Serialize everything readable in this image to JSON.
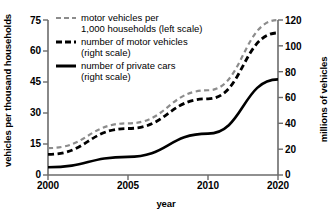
{
  "chart_data": {
    "type": "line",
    "title": "",
    "xlabel": "year",
    "ylabel_left": "vehicles per thousand households",
    "ylabel_right": "millions of vehicles",
    "x": [
      2000,
      2005,
      2010,
      2020
    ],
    "x_tick_labels": [
      "2000",
      "2005",
      "2010",
      "2020"
    ],
    "left_axis": {
      "label": "vehicles per thousand households",
      "ticks": [
        0,
        15,
        30,
        45,
        60,
        75
      ],
      "tick_labels": [
        "0",
        "15",
        "30",
        "45",
        "60",
        "75"
      ],
      "ylim": [
        0,
        75
      ]
    },
    "right_axis": {
      "label": "millions of vehicles",
      "ticks": [
        0,
        20,
        40,
        60,
        80,
        100,
        120
      ],
      "tick_labels": [
        "0",
        "20",
        "40",
        "60",
        "80",
        "100",
        "120"
      ],
      "ylim": [
        0,
        120
      ]
    },
    "grid": false,
    "legend_position": "upper-left-inside",
    "series": [
      {
        "name": "motor vehicles per 1,000 households (left scale)",
        "legend_line1": "motor vehicles per",
        "legend_line2": "1,000 households (left scale)",
        "axis": "left",
        "style": "dashed",
        "color": "#8c8c8c",
        "width": 2.2,
        "values": [
          13,
          25,
          41,
          75
        ]
      },
      {
        "name": "number of motor vehicles (right scale)",
        "legend_line1": "number of motor vehicles",
        "legend_line2": "(right scale)",
        "axis": "right",
        "style": "dashed",
        "color": "#000000",
        "width": 2.8,
        "values": [
          16,
          36,
          59,
          110
        ]
      },
      {
        "name": "number of private cars (right scale)",
        "legend_line1": "number of private cars",
        "legend_line2": "(right scale)",
        "axis": "right",
        "style": "solid",
        "color": "#000000",
        "width": 2.6,
        "values": [
          6,
          14,
          32,
          74
        ]
      }
    ]
  },
  "colors": {
    "axis": "#6b6b6b",
    "series_gray": "#8c8c8c",
    "series_black": "#000000",
    "background": "#ffffff"
  },
  "axes": {
    "left_tick_labels": [
      "75",
      "60",
      "45",
      "30",
      "15",
      "0"
    ],
    "right_tick_labels": [
      "120",
      "100",
      "80",
      "60",
      "40",
      "20",
      "0"
    ],
    "x_tick_labels": [
      "2000",
      "2005",
      "2010",
      "2020"
    ],
    "x_title": "year",
    "y_left_title": "vehicles per thousand households",
    "y_right_title": "millions of vehicles"
  },
  "legend": {
    "items": [
      {
        "line1": "motor vehicles per",
        "line2": "1,000 households (left scale)"
      },
      {
        "line1": "number of motor vehicles",
        "line2": "(right scale)"
      },
      {
        "line1": "number of private cars",
        "line2": "(right scale)"
      }
    ]
  }
}
